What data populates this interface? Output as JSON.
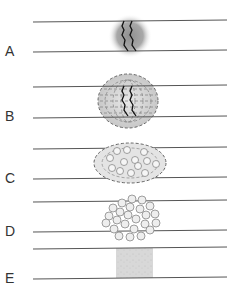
{
  "diagram": {
    "panels": [
      {
        "label": "A",
        "stage": "fracture-hematoma"
      },
      {
        "label": "B",
        "stage": "fibrocartilaginous-callus"
      },
      {
        "label": "C",
        "stage": "soft-callus-with-cells"
      },
      {
        "label": "D",
        "stage": "bony-callus"
      },
      {
        "label": "E",
        "stage": "remodeled-bone"
      }
    ],
    "colors": {
      "line": "#555555",
      "fracture": "#111111",
      "hematoma": "#9a9a9a",
      "callus": "#d9d9d9",
      "dash": "#666666",
      "cell_fill": "#eeeeee",
      "cell_stroke": "#888888",
      "bone": "#d6d6d6"
    }
  }
}
